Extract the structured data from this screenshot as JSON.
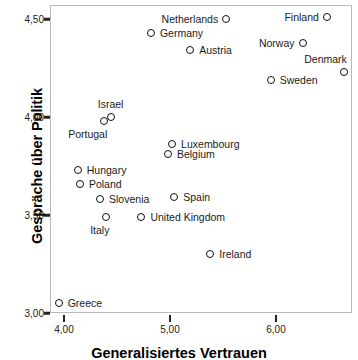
{
  "chart_data": {
    "type": "scatter",
    "title": "",
    "xlabel": "Generalisiertes Vertrauen",
    "ylabel": "Gespräche über Politik",
    "xlim": [
      3.87,
      6.72
    ],
    "ylim": [
      2.98,
      4.57
    ],
    "xticks": [
      "4,00",
      "5,00",
      "6,00"
    ],
    "xtick_values": [
      4.0,
      5.0,
      6.0
    ],
    "yticks": [
      "4,50",
      "4,00",
      "3,50",
      "3,00"
    ],
    "ytick_values": [
      4.5,
      4.0,
      3.5,
      3.0
    ],
    "grid": false,
    "legend": "none",
    "marker": "open-circle",
    "points": [
      {
        "label": "Netherlands",
        "x": 5.53,
        "y": 4.5,
        "label_side": "left"
      },
      {
        "label": "Finland",
        "x": 6.48,
        "y": 4.51,
        "label_side": "left"
      },
      {
        "label": "Germany",
        "x": 4.82,
        "y": 4.43,
        "label_side": "right"
      },
      {
        "label": "Norway",
        "x": 6.25,
        "y": 4.38,
        "label_side": "left"
      },
      {
        "label": "Austria",
        "x": 5.19,
        "y": 4.34,
        "label_side": "right"
      },
      {
        "label": "Denmark",
        "x": 6.64,
        "y": 4.23,
        "label_side": "above-left"
      },
      {
        "label": "Sweden",
        "x": 5.95,
        "y": 4.19,
        "label_side": "right"
      },
      {
        "label": "Israel",
        "x": 4.44,
        "y": 4.0,
        "label_side": "above"
      },
      {
        "label": "Portugal",
        "x": 4.38,
        "y": 3.98,
        "label_side": "below-left"
      },
      {
        "label": "Luxembourg",
        "x": 5.02,
        "y": 3.86,
        "label_side": "right"
      },
      {
        "label": "Belgium",
        "x": 4.98,
        "y": 3.81,
        "label_side": "right"
      },
      {
        "label": "Hungary",
        "x": 4.13,
        "y": 3.73,
        "label_side": "right"
      },
      {
        "label": "Poland",
        "x": 4.15,
        "y": 3.66,
        "label_side": "right"
      },
      {
        "label": "Slovenia",
        "x": 4.34,
        "y": 3.58,
        "label_side": "right"
      },
      {
        "label": "Spain",
        "x": 5.04,
        "y": 3.59,
        "label_side": "right"
      },
      {
        "label": "United Kingdom",
        "x": 4.73,
        "y": 3.49,
        "label_side": "right"
      },
      {
        "label": "Italy",
        "x": 4.4,
        "y": 3.49,
        "label_side": "below-left"
      },
      {
        "label": "Ireland",
        "x": 5.38,
        "y": 3.3,
        "label_side": "right"
      },
      {
        "label": "Greece",
        "x": 3.95,
        "y": 3.05,
        "label_side": "right"
      }
    ]
  },
  "colors": {
    "marker_stroke": "#111111",
    "axis": "#222222",
    "frame": "#b9b9b9",
    "text": "#1a1a1a",
    "background": "#ffffff"
  }
}
